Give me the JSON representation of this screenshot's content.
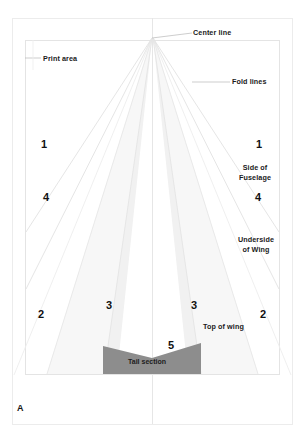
{
  "sheet": {
    "letter": "A",
    "page_bg": "#ffffff",
    "page_border_color": "#e9e9e9",
    "print_border_color": "#e3e3e3",
    "fold_line_color": "#e0e0e0",
    "center_line_color": "#e6e6e6",
    "leader_color": "#b9b9b9",
    "wing_fill": "#f0f0f0",
    "wing_fill_light": "#f6f6f6",
    "tail_fill": "#8d8d8d",
    "text_color": "#1a1a1a"
  },
  "callouts": {
    "center_line": "Center line",
    "print_area": "Print area",
    "fold_lines": "Fold lines",
    "side_of_fuselage": "Side of\nFuselage",
    "underside_of_wing": "Underside\nof Wing",
    "top_of_wing": "Top of wing",
    "tail_section": "Tail section"
  },
  "fold_numbers": {
    "left_1": "1",
    "right_1": "1",
    "left_4": "4",
    "right_4": "4",
    "left_2": "2",
    "right_2": "2",
    "left_3": "3",
    "right_3": "3",
    "tail_5": "5"
  }
}
